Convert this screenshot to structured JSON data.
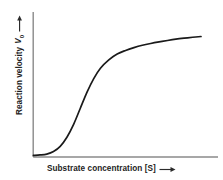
{
  "figure": {
    "background_color": "#ffffff",
    "axis_color": "#8a8a8a",
    "curve_color": "#1a1a1a",
    "text_color": "#1d1d1d"
  },
  "labels": {
    "y_axis_text": "Reaction velocity",
    "y_axis_symbol": "V",
    "y_axis_subscript": "0",
    "y_axis_arrow": "arrow-right-icon",
    "x_axis_text": "Substrate concentration [S]",
    "x_axis_arrow": "arrow-right-icon"
  },
  "chart_data": {
    "type": "line",
    "title": "",
    "subtitle": "",
    "xlabel": "Substrate concentration [S]",
    "ylabel": "Reaction velocity V0",
    "grid": false,
    "legend": null,
    "xlim": [
      0,
      1
    ],
    "ylim": [
      0,
      1
    ],
    "tick_labels_x": [],
    "tick_labels_y": [],
    "annotations": [],
    "series": [
      {
        "name": "Sigmoidal velocity curve",
        "x": [
          0.0,
          0.04,
          0.08,
          0.12,
          0.16,
          0.2,
          0.24,
          0.28,
          0.32,
          0.36,
          0.4,
          0.45,
          0.5,
          0.55,
          0.6,
          0.65,
          0.7,
          0.75,
          0.8,
          0.85,
          0.9,
          0.95,
          1.0
        ],
        "y": [
          0.005,
          0.008,
          0.015,
          0.035,
          0.075,
          0.145,
          0.245,
          0.37,
          0.495,
          0.6,
          0.68,
          0.745,
          0.79,
          0.818,
          0.84,
          0.858,
          0.872,
          0.884,
          0.895,
          0.905,
          0.913,
          0.92,
          0.926
        ]
      }
    ]
  },
  "geometry": {
    "y_axis_x": 33,
    "x_axis_y": 157,
    "x_axis_end": 218,
    "y_axis_top": 12
  }
}
